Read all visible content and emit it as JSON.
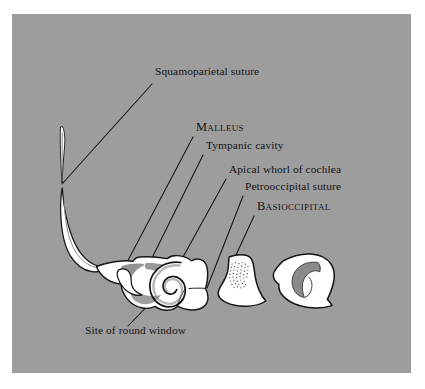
{
  "figure": {
    "type": "anatomical-illustration",
    "panel_background_color": "#9d9d9d",
    "page_background_color": "#ffffff",
    "ink_color": "#151515",
    "bone_fill_color": "#ffffff",
    "shading_color": "#7d7d7d"
  },
  "labels": [
    {
      "id": "squamoparietal-suture",
      "text": "Squamoparietal suture",
      "style": "roman",
      "x": 155,
      "y": 72,
      "leader": {
        "from_x": 152,
        "from_y": 84,
        "to_x": 62,
        "to_y": 184
      }
    },
    {
      "id": "malleus",
      "text": "Malleus",
      "style": "small-caps",
      "x": 196,
      "y": 129,
      "leader": {
        "from_x": 193,
        "from_y": 137,
        "to_x": 124,
        "to_y": 268
      }
    },
    {
      "id": "tympanic-cavity",
      "text": "Tympanic cavity",
      "style": "roman",
      "x": 206,
      "y": 146,
      "leader": {
        "from_x": 203,
        "from_y": 155,
        "to_x": 148,
        "to_y": 266
      }
    },
    {
      "id": "apical-whorl-of-cochlea",
      "text": "Apical whorl of cochlea",
      "style": "roman",
      "x": 229,
      "y": 170,
      "leader": {
        "from_x": 226,
        "from_y": 179,
        "to_x": 177,
        "to_y": 268
      }
    },
    {
      "id": "petrooccipital-suture",
      "text": "Petrooccipital suture",
      "style": "roman",
      "x": 245,
      "y": 187,
      "leader": {
        "from_x": 243,
        "from_y": 196,
        "to_x": 207,
        "to_y": 288
      }
    },
    {
      "id": "basioccipital",
      "text": "Basioccipital",
      "style": "small-caps",
      "x": 257,
      "y": 208,
      "leader": {
        "from_x": 254,
        "from_y": 216,
        "to_x": 230,
        "to_y": 268
      }
    },
    {
      "id": "site-of-round-window",
      "text": "Site of round window",
      "style": "roman",
      "x": 85,
      "y": 330,
      "leader": {
        "from_x": 128,
        "from_y": 326,
        "to_x": 163,
        "to_y": 290
      }
    }
  ],
  "structures": [
    {
      "id": "squamosal-process-sliver",
      "name": "squamosal process sliver"
    },
    {
      "id": "zygomatic-process",
      "name": "zygomatic / anterior process"
    },
    {
      "id": "petrosal-body",
      "name": "petrosal body"
    },
    {
      "id": "malleus-ossicle",
      "name": "malleus ossicle"
    },
    {
      "id": "cochlear-spiral",
      "name": "cochlear spiral whorl"
    },
    {
      "id": "basioccipital-element",
      "name": "basioccipital element"
    },
    {
      "id": "basioccipital-stipple",
      "name": "basioccipital stippled surface"
    },
    {
      "id": "right-element",
      "name": "right bone element with internal hook"
    }
  ]
}
